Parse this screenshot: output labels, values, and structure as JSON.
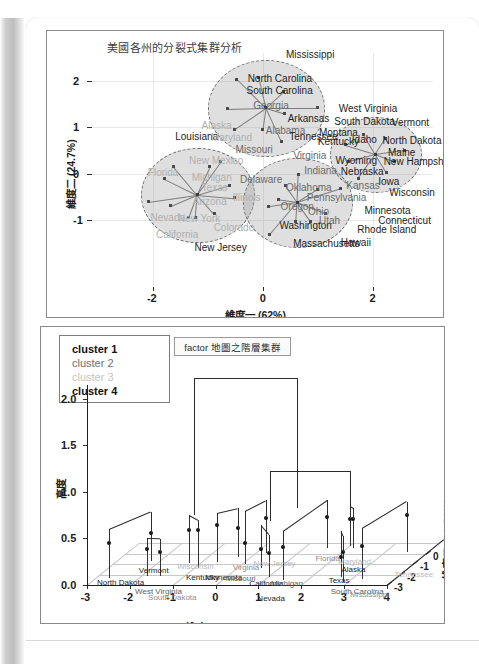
{
  "document": {
    "kind": "scanned-page",
    "page_background": "#ffffff",
    "gutter_shadow": "#bdbdbd"
  },
  "figures": [
    {
      "id": "divisive-cluster-plot",
      "title": "美國各州的分裂式集群分析",
      "chart_type": "scatter",
      "xlabel": "維度一 (62%)",
      "ylabel": "維度二 (24.7%)",
      "xticks": [
        "-2",
        "0",
        "2"
      ],
      "yticks": [
        "-1",
        "0",
        "1",
        "2"
      ],
      "xlim": [
        -3.1,
        3.1
      ],
      "ylim": [
        -2.4,
        2.6
      ],
      "grid": true,
      "clusters": [
        {
          "name": "cluster 1",
          "cx": 0.05,
          "cy": 1.42,
          "rx": 1.05,
          "ry": 1.02
        },
        {
          "name": "cluster 2",
          "cx": -1.2,
          "cy": -0.45,
          "rx": 1.02,
          "ry": 1.0
        },
        {
          "name": "cluster 3",
          "cx": 0.62,
          "cy": -0.62,
          "rx": 0.98,
          "ry": 0.95
        },
        {
          "name": "cluster 4",
          "cx": 2.05,
          "cy": 0.42,
          "rx": 0.82,
          "ry": 0.8
        }
      ],
      "labels": [
        {
          "text": "Mississippi",
          "x": 0.42,
          "y": 2.55,
          "tone": "dark"
        },
        {
          "text": "North Carolina",
          "x": -0.28,
          "y": 2.05,
          "tone": "dark"
        },
        {
          "text": "South Carolina",
          "x": -0.3,
          "y": 1.78,
          "tone": "dark"
        },
        {
          "text": "Georgia",
          "x": -0.18,
          "y": 1.45,
          "tone": "mid"
        },
        {
          "text": "Arkansas",
          "x": 0.45,
          "y": 1.18,
          "tone": "dark"
        },
        {
          "text": "Alabama",
          "x": 0.05,
          "y": 0.92,
          "tone": "mid"
        },
        {
          "text": "Tennessee",
          "x": 0.48,
          "y": 0.8,
          "tone": "dark"
        },
        {
          "text": "Alaska",
          "x": -1.12,
          "y": 1.02,
          "tone": "light"
        },
        {
          "text": "Louisiana",
          "x": -1.6,
          "y": 0.8,
          "tone": "dark"
        },
        {
          "text": "Maryland",
          "x": -0.95,
          "y": 0.76,
          "tone": "light"
        },
        {
          "text": "Missouri",
          "x": -0.5,
          "y": 0.52,
          "tone": "mid"
        },
        {
          "text": "Kentucky",
          "x": 1.0,
          "y": 0.68,
          "tone": "dark"
        },
        {
          "text": "Virginia",
          "x": 0.55,
          "y": 0.38,
          "tone": "mid"
        },
        {
          "text": "New Mexico",
          "x": -1.35,
          "y": 0.28,
          "tone": "light"
        },
        {
          "text": "Florida",
          "x": -2.1,
          "y": 0.02,
          "tone": "light"
        },
        {
          "text": "Michigan",
          "x": -1.3,
          "y": -0.1,
          "tone": "light"
        },
        {
          "text": "Delaware",
          "x": -0.42,
          "y": -0.14,
          "tone": "mid"
        },
        {
          "text": "Texas",
          "x": -1.12,
          "y": -0.32,
          "tone": "light"
        },
        {
          "text": "Illinois",
          "x": -0.55,
          "y": -0.52,
          "tone": "light"
        },
        {
          "text": "Arizona",
          "x": -1.28,
          "y": -0.62,
          "tone": "light"
        },
        {
          "text": "Nevada",
          "x": -2.05,
          "y": -0.95,
          "tone": "light"
        },
        {
          "text": "New York",
          "x": -1.55,
          "y": -0.98,
          "tone": "light"
        },
        {
          "text": "Colorado",
          "x": -0.9,
          "y": -1.18,
          "tone": "light"
        },
        {
          "text": "California",
          "x": -1.95,
          "y": -1.32,
          "tone": "light"
        },
        {
          "text": "New Jersey",
          "x": -1.25,
          "y": -1.6,
          "tone": "dark"
        },
        {
          "text": "West Virginia",
          "x": 1.38,
          "y": 1.4,
          "tone": "dark"
        },
        {
          "text": "South Dakota",
          "x": 1.3,
          "y": 1.12,
          "tone": "dark"
        },
        {
          "text": "Vermont",
          "x": 2.35,
          "y": 1.1,
          "tone": "dark"
        },
        {
          "text": "Montana",
          "x": 1.02,
          "y": 0.88,
          "tone": "dark"
        },
        {
          "text": "Idaho",
          "x": 1.62,
          "y": 0.72,
          "tone": "dark"
        },
        {
          "text": "North Dakota",
          "x": 2.18,
          "y": 0.7,
          "tone": "dark"
        },
        {
          "text": "Maine",
          "x": 2.28,
          "y": 0.45,
          "tone": "dark"
        },
        {
          "text": "Wyoming",
          "x": 1.32,
          "y": 0.28,
          "tone": "dark"
        },
        {
          "text": "New Hampshire",
          "x": 2.2,
          "y": 0.26,
          "tone": "dark"
        },
        {
          "text": "Nebraska",
          "x": 1.42,
          "y": 0.04,
          "tone": "dark"
        },
        {
          "text": "Indiana",
          "x": 0.75,
          "y": 0.06,
          "tone": "mid"
        },
        {
          "text": "Iowa",
          "x": 2.1,
          "y": -0.18,
          "tone": "dark"
        },
        {
          "text": "Kansas",
          "x": 1.52,
          "y": -0.26,
          "tone": "mid"
        },
        {
          "text": "Oklahoma",
          "x": 0.42,
          "y": -0.32,
          "tone": "mid"
        },
        {
          "text": "Wisconsin",
          "x": 2.3,
          "y": -0.42,
          "tone": "dark"
        },
        {
          "text": "Pennsylvania",
          "x": 0.8,
          "y": -0.52,
          "tone": "mid"
        },
        {
          "text": "Oregon",
          "x": 0.32,
          "y": -0.72,
          "tone": "mid"
        },
        {
          "text": "Ohio",
          "x": 0.82,
          "y": -0.82,
          "tone": "mid"
        },
        {
          "text": "Minnesota",
          "x": 1.85,
          "y": -0.8,
          "tone": "dark"
        },
        {
          "text": "Connecticut",
          "x": 2.1,
          "y": -1.02,
          "tone": "dark"
        },
        {
          "text": "Washington",
          "x": 0.3,
          "y": -1.12,
          "tone": "dark"
        },
        {
          "text": "Utah",
          "x": 1.02,
          "y": -1.02,
          "tone": "mid"
        },
        {
          "text": "Rhode Island",
          "x": 1.72,
          "y": -1.22,
          "tone": "dark"
        },
        {
          "text": "Massachusetts",
          "x": 0.55,
          "y": -1.52,
          "tone": "dark"
        },
        {
          "text": "Hawaii",
          "x": 1.42,
          "y": -1.5,
          "tone": "dark"
        }
      ]
    },
    {
      "id": "hierarchical-3d-plot",
      "title": "factor 地圖之階層集群",
      "chart_type": "scatter",
      "xlabel": "維度一   (62.01%)",
      "ylabel": "高度",
      "zlabel": "維度二   (24.74%)",
      "xticks": [
        "-3",
        "-2",
        "-1",
        "0",
        "1",
        "2",
        "3",
        "4"
      ],
      "yticks": [
        "0.0",
        "0.5",
        "1.0",
        "1.5",
        "2.0"
      ],
      "zticks": [
        "-3",
        "-2",
        "-1",
        "0",
        "1"
      ],
      "legend": {
        "position": "top-left",
        "items": [
          {
            "label": "cluster 1",
            "color": "#111111"
          },
          {
            "label": "cluster 2",
            "color": "#6f6f6f"
          },
          {
            "label": "cluster 3",
            "color": "#c3c3c3"
          },
          {
            "label": "cluster 4",
            "color": "#111111"
          }
        ]
      },
      "leaf_labels": [
        "North Dakota",
        "Vermont",
        "West Virginia",
        "South Dakota",
        "Wisconsin",
        "Kentucky",
        "Minnesota",
        "Missouri",
        "Virginia",
        "New Jersey",
        "California",
        "Nevada",
        "Michigan",
        "Florida",
        "Maryland",
        "Alaska",
        "Texas",
        "South Carolina",
        "Mississippi",
        "Tennessee"
      ]
    }
  ]
}
